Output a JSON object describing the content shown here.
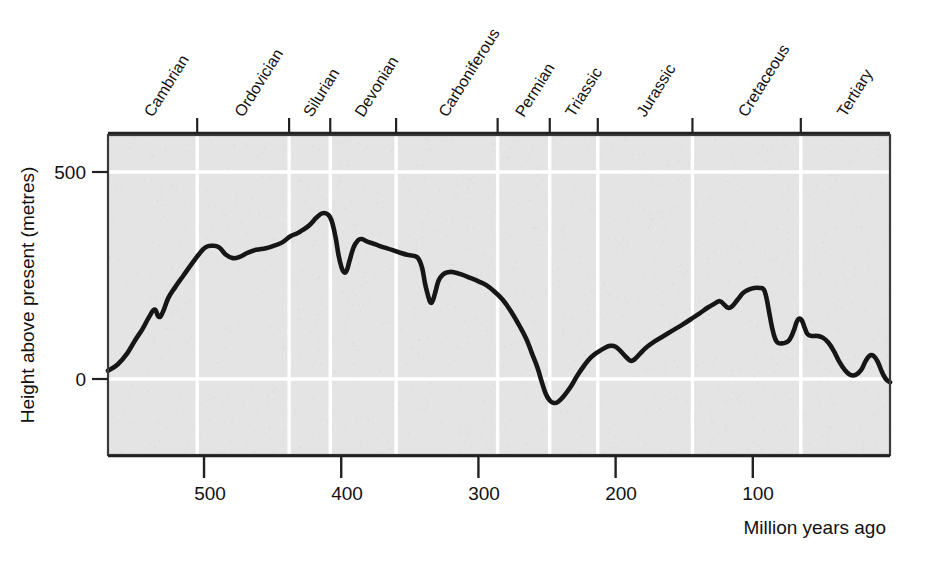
{
  "chart_data": {
    "type": "line",
    "title": "",
    "xlabel": "Million years ago",
    "ylabel": "Height above present (metres)",
    "xlim": [
      570,
      0
    ],
    "ylim": [
      -135,
      560
    ],
    "x_ticks": [
      500,
      400,
      300,
      200,
      100
    ],
    "x_tick_labels": [
      "500",
      "400",
      "300",
      "200",
      "100"
    ],
    "y_ticks": [
      0,
      500
    ],
    "y_tick_labels": [
      "0",
      "500"
    ],
    "grid": "vertical white gridlines at geological period boundaries; horizontal white gridlines at 0 and 500",
    "legend": "none",
    "series": [
      {
        "name": "Sea level height above present",
        "points": [
          [
            570,
            20
          ],
          [
            563,
            35
          ],
          [
            556,
            62
          ],
          [
            550,
            95
          ],
          [
            545,
            120
          ],
          [
            540,
            150
          ],
          [
            536,
            168
          ],
          [
            533,
            150
          ],
          [
            530,
            162
          ],
          [
            526,
            196
          ],
          [
            521,
            222
          ],
          [
            515,
            250
          ],
          [
            509,
            278
          ],
          [
            504,
            300
          ],
          [
            499,
            318
          ],
          [
            494,
            322
          ],
          [
            489,
            318
          ],
          [
            484,
            300
          ],
          [
            479,
            292
          ],
          [
            474,
            295
          ],
          [
            468,
            305
          ],
          [
            462,
            312
          ],
          [
            455,
            316
          ],
          [
            449,
            322
          ],
          [
            443,
            330
          ],
          [
            437,
            345
          ],
          [
            432,
            352
          ],
          [
            428,
            360
          ],
          [
            423,
            372
          ],
          [
            418,
            390
          ],
          [
            414,
            400
          ],
          [
            410,
            398
          ],
          [
            407,
            382
          ],
          [
            404,
            340
          ],
          [
            402,
            300
          ],
          [
            400,
            272
          ],
          [
            398,
            258
          ],
          [
            396,
            262
          ],
          [
            394,
            285
          ],
          [
            391,
            318
          ],
          [
            388,
            334
          ],
          [
            385,
            338
          ],
          [
            381,
            332
          ],
          [
            375,
            325
          ],
          [
            369,
            318
          ],
          [
            363,
            312
          ],
          [
            357,
            305
          ],
          [
            352,
            300
          ],
          [
            348,
            298
          ],
          [
            344,
            292
          ],
          [
            341,
            268
          ],
          [
            339,
            232
          ],
          [
            337,
            205
          ],
          [
            335,
            185
          ],
          [
            333,
            192
          ],
          [
            331,
            215
          ],
          [
            329,
            238
          ],
          [
            326,
            252
          ],
          [
            322,
            258
          ],
          [
            318,
            258
          ],
          [
            312,
            252
          ],
          [
            306,
            244
          ],
          [
            300,
            236
          ],
          [
            294,
            226
          ],
          [
            288,
            210
          ],
          [
            282,
            190
          ],
          [
            276,
            162
          ],
          [
            270,
            128
          ],
          [
            265,
            96
          ],
          [
            261,
            62
          ],
          [
            257,
            28
          ],
          [
            254,
            -5
          ],
          [
            251,
            -35
          ],
          [
            248,
            -52
          ],
          [
            245,
            -58
          ],
          [
            242,
            -55
          ],
          [
            238,
            -42
          ],
          [
            233,
            -20
          ],
          [
            228,
            8
          ],
          [
            223,
            32
          ],
          [
            218,
            52
          ],
          [
            213,
            65
          ],
          [
            208,
            75
          ],
          [
            204,
            80
          ],
          [
            200,
            78
          ],
          [
            196,
            66
          ],
          [
            192,
            52
          ],
          [
            189,
            44
          ],
          [
            186,
            48
          ],
          [
            182,
            62
          ],
          [
            177,
            78
          ],
          [
            171,
            92
          ],
          [
            165,
            104
          ],
          [
            158,
            118
          ],
          [
            151,
            132
          ],
          [
            145,
            145
          ],
          [
            139,
            158
          ],
          [
            133,
            172
          ],
          [
            128,
            182
          ],
          [
            124,
            188
          ],
          [
            121,
            180
          ],
          [
            118,
            172
          ],
          [
            115,
            176
          ],
          [
            111,
            192
          ],
          [
            107,
            208
          ],
          [
            103,
            216
          ],
          [
            99,
            220
          ],
          [
            95,
            220
          ],
          [
            92,
            216
          ],
          [
            90,
            195
          ],
          [
            88,
            160
          ],
          [
            86,
            125
          ],
          [
            84,
            100
          ],
          [
            82,
            88
          ],
          [
            79,
            86
          ],
          [
            76,
            88
          ],
          [
            73,
            96
          ],
          [
            70,
            118
          ],
          [
            68,
            138
          ],
          [
            66,
            146
          ],
          [
            64,
            140
          ],
          [
            62,
            122
          ],
          [
            60,
            108
          ],
          [
            57,
            104
          ],
          [
            53,
            104
          ],
          [
            49,
            100
          ],
          [
            45,
            88
          ],
          [
            41,
            68
          ],
          [
            37,
            42
          ],
          [
            33,
            22
          ],
          [
            29,
            10
          ],
          [
            25,
            10
          ],
          [
            21,
            22
          ],
          [
            18,
            42
          ],
          [
            15,
            56
          ],
          [
            12,
            56
          ],
          [
            9,
            42
          ],
          [
            6,
            18
          ],
          [
            3,
            0
          ],
          [
            0,
            -8
          ]
        ]
      }
    ],
    "periods": [
      {
        "name": "Cambrian",
        "start": 570,
        "end": 505
      },
      {
        "name": "Ordovician",
        "start": 505,
        "end": 438
      },
      {
        "name": "Silurian",
        "start": 438,
        "end": 408
      },
      {
        "name": "Devonian",
        "start": 408,
        "end": 360
      },
      {
        "name": "Carboniferous",
        "start": 360,
        "end": 286
      },
      {
        "name": "Permian",
        "start": 286,
        "end": 248
      },
      {
        "name": "Triassic",
        "start": 248,
        "end": 213
      },
      {
        "name": "Jurassic",
        "start": 213,
        "end": 144
      },
      {
        "name": "Cretaceous",
        "start": 144,
        "end": 65
      },
      {
        "name": "Tertiary",
        "start": 65,
        "end": 0
      }
    ],
    "colors": {
      "plot_background": "#e4e4e4",
      "curve": "#161616",
      "gridline": "#ffffff",
      "frame": "#333333",
      "text": "#111111"
    }
  },
  "axes": {
    "y_label": "Height above present (metres)",
    "x_label": "Million years ago",
    "y_tick_500": "500",
    "y_tick_0": "0",
    "x_tick_500": "500",
    "x_tick_400": "400",
    "x_tick_300": "300",
    "x_tick_200": "200",
    "x_tick_100": "100"
  },
  "period_labels": {
    "p0": "Cambrian",
    "p1": "Ordovician",
    "p2": "Silurian",
    "p3": "Devonian",
    "p4": "Carboniferous",
    "p5": "Permian",
    "p6": "Triassic",
    "p7": "Jurassic",
    "p8": "Cretaceous",
    "p9": "Tertiary"
  }
}
